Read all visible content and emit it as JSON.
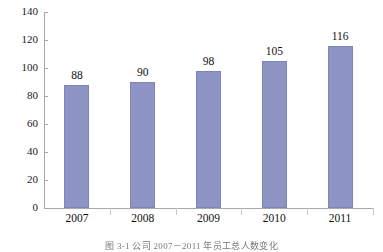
{
  "chart_data": {
    "type": "bar",
    "title": "",
    "xlabel": "",
    "ylabel": "",
    "categories": [
      "2007",
      "2008",
      "2009",
      "2010",
      "2011"
    ],
    "values": [
      88,
      90,
      98,
      105,
      116
    ],
    "value_labels": [
      "88",
      "90",
      "98",
      "105",
      "116"
    ],
    "ylim": [
      0,
      140
    ],
    "yticks": [
      0,
      20,
      40,
      60,
      80,
      100,
      120,
      140
    ],
    "ytick_labels": [
      "0",
      "20",
      "40",
      "60",
      "80",
      "100",
      "120",
      "140"
    ],
    "grid": false,
    "legend": "none",
    "series": [
      {
        "name": "员工总人数",
        "values": [
          88,
          90,
          98,
          105,
          116
        ],
        "color": "#8e95c4"
      }
    ]
  },
  "caption": {
    "text": "图 3-1  公司 2007－2011 年员工总人数变化"
  },
  "colors": {
    "bar_fill": "#8e95c4",
    "bar_edge": "#7d85b8",
    "axis": "#a9a9a9",
    "text": "#111111",
    "background": "#ffffff"
  }
}
